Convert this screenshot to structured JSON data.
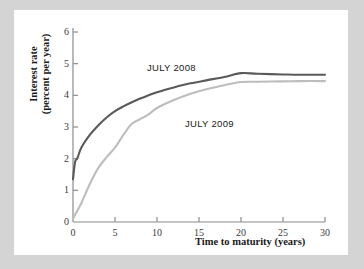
{
  "figure": {
    "background_color": "#d4d4d4",
    "panel_color": "#ffffff"
  },
  "chart_data": {
    "type": "line",
    "title": "",
    "xlabel": "Time to maturity (years)",
    "ylabel": "Interest rate (percent per year)",
    "ylabel_line1": "Interest rate",
    "ylabel_line2": "(percent per year)",
    "xlim": [
      0,
      30
    ],
    "ylim": [
      0,
      6
    ],
    "xticks": [
      0,
      5,
      10,
      15,
      20,
      25,
      30
    ],
    "xtick_labels": [
      "0",
      "5",
      "10",
      "15",
      "20",
      "25",
      "30"
    ],
    "yticks": [
      0,
      1,
      2,
      3,
      4,
      5,
      6
    ],
    "ytick_labels": [
      "0",
      "1",
      "2",
      "3",
      "4",
      "5",
      "6"
    ],
    "grid": false,
    "legend": "inline-annotations",
    "series": [
      {
        "name": "JULY 2008",
        "color": "#5a5a5a",
        "x": [
          0,
          0.25,
          0.5,
          1,
          2,
          3,
          4,
          5,
          6,
          7,
          8,
          9,
          10,
          12,
          14,
          16,
          18,
          20,
          22,
          25,
          27,
          30
        ],
        "values": [
          1.35,
          1.9,
          2.0,
          2.35,
          2.75,
          3.05,
          3.3,
          3.5,
          3.65,
          3.78,
          3.9,
          4.0,
          4.1,
          4.25,
          4.38,
          4.48,
          4.58,
          4.7,
          4.68,
          4.66,
          4.65,
          4.65
        ]
      },
      {
        "name": "JULY 2009",
        "color": "#bdbdbd",
        "x": [
          0,
          0.5,
          1,
          2,
          3,
          4,
          5,
          6,
          7,
          8,
          9,
          10,
          12,
          14,
          16,
          18,
          20,
          22,
          25,
          27,
          30
        ],
        "values": [
          0.1,
          0.35,
          0.6,
          1.2,
          1.7,
          2.05,
          2.35,
          2.75,
          3.1,
          3.25,
          3.4,
          3.6,
          3.85,
          4.05,
          4.2,
          4.32,
          4.42,
          4.43,
          4.44,
          4.45,
          4.45
        ]
      }
    ],
    "annotations": [
      {
        "text": "JULY 2008",
        "x": 11.5,
        "y": 5.2
      },
      {
        "text": "JULY 2009",
        "x": 15.5,
        "y": 3.6
      }
    ]
  },
  "axis": {
    "line_color": "#8c8c8c",
    "tick_color": "#8c8c8c"
  }
}
